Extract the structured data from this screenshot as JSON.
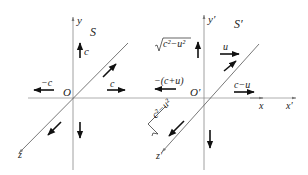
{
  "left_frame": {
    "frame_label": "S",
    "origin_label": "O",
    "axis_y_label": "y",
    "axis_z_label": "z",
    "velocity_labels": {
      "up": "c",
      "left": "−c",
      "right": "c"
    }
  },
  "right_frame": {
    "frame_label": "S′",
    "origin_label": "O′",
    "axis_y_label": "y′",
    "axis_z_label": "z′",
    "axis_x_label": "x",
    "axis_x_prime_label": "x′",
    "velocity_labels": {
      "frame_velocity": "u",
      "up": "√ c²−u²",
      "up_radicand": "c²−u²",
      "left": "−(c+u)",
      "right": "c−u",
      "diag_radicand": "c²−u²"
    }
  },
  "colors": {
    "axis": "#888888",
    "arrow": "#111111",
    "text": "#222222"
  }
}
